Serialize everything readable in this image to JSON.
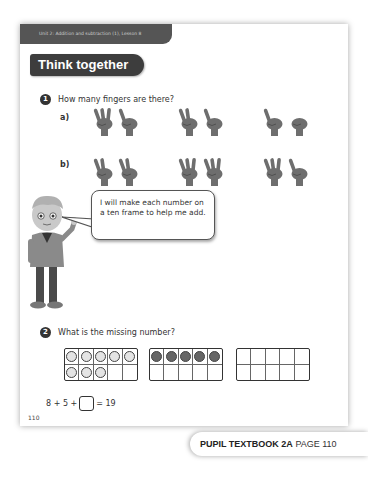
{
  "header": {
    "unit_label": "Unit 2: Addition and subtraction (1), Lesson 8",
    "section_title": "Think together"
  },
  "questions": [
    {
      "number": "1",
      "text": "How many fingers are there?",
      "parts": [
        {
          "label": "a)",
          "pairs": [
            [
              3,
              1
            ],
            [
              2,
              1
            ],
            [
              1,
              0
            ]
          ]
        },
        {
          "label": "b)",
          "pairs": [
            [
              2,
              2
            ],
            [
              3,
              3
            ],
            [
              3,
              1
            ]
          ]
        }
      ]
    },
    {
      "number": "2",
      "text": "What is the missing number?",
      "ten_frames": [
        {
          "filled": 8,
          "style": "light"
        },
        {
          "filled": 5,
          "style": "dark"
        },
        {
          "filled": 0,
          "style": "empty"
        }
      ],
      "equation": {
        "left": "8 + 5 +",
        "right": "= 19"
      }
    }
  ],
  "speech_bubble": "I will make each number on a ten frame to help me add.",
  "page_number": "110",
  "footer": {
    "book": "PUPIL TEXTBOOK 2A",
    "page": "PAGE 110"
  },
  "colors": {
    "header_bar": "#555555",
    "title_pill": "#3d3d3d",
    "counter_light": "#e4e4e4",
    "counter_dark": "#666666"
  }
}
